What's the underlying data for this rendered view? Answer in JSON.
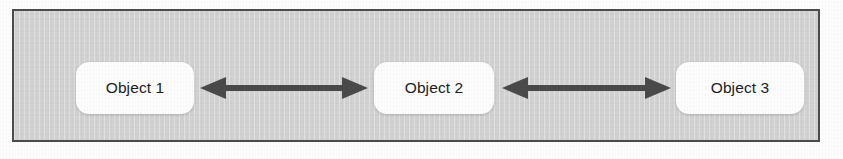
{
  "diagram": {
    "panel": {
      "background_color": "#d2d2d2",
      "border_color": "#4c4c4c"
    },
    "nodes": [
      {
        "id": "object-1",
        "label": "Object 1"
      },
      {
        "id": "object-2",
        "label": "Object 2"
      },
      {
        "id": "object-3",
        "label": "Object 3"
      }
    ],
    "connectors": [
      {
        "id": "connector-1",
        "from": "Object 1",
        "to": "Object 2",
        "style": "double-headed-arrow",
        "color": "#4a4a4a"
      },
      {
        "id": "connector-2",
        "from": "Object 2",
        "to": "Object 3",
        "style": "double-headed-arrow",
        "color": "#4a4a4a"
      }
    ],
    "node_style": {
      "fill": "#fdfdfd",
      "text_color": "#1c1c1c"
    }
  }
}
